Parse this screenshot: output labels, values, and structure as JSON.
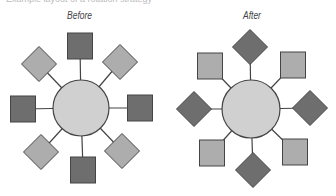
{
  "header": {
    "cutoff_text": "Example layout of a rotation strategy"
  },
  "panels": [
    {
      "label": "Before",
      "center": {
        "cx": 81,
        "cy": 108,
        "r": 28
      },
      "nodes": [
        {
          "shape": "square",
          "tone": "dark",
          "cx": 80,
          "cy": 46
        },
        {
          "shape": "diamond",
          "tone": "light",
          "cx": 39,
          "cy": 64
        },
        {
          "shape": "diamond",
          "tone": "light",
          "cx": 120,
          "cy": 62
        },
        {
          "shape": "square",
          "tone": "dark",
          "cx": 23,
          "cy": 109
        },
        {
          "shape": "square",
          "tone": "dark",
          "cx": 140,
          "cy": 108
        },
        {
          "shape": "diamond",
          "tone": "light",
          "cx": 41,
          "cy": 152
        },
        {
          "shape": "diamond",
          "tone": "light",
          "cx": 122,
          "cy": 151
        },
        {
          "shape": "square",
          "tone": "dark",
          "cx": 83,
          "cy": 170
        }
      ]
    },
    {
      "label": "After",
      "center": {
        "cx": 251,
        "cy": 109,
        "r": 29
      },
      "nodes": [
        {
          "shape": "diamond",
          "tone": "dark",
          "cx": 250,
          "cy": 47
        },
        {
          "shape": "square",
          "tone": "light",
          "cx": 210,
          "cy": 66
        },
        {
          "shape": "square",
          "tone": "light",
          "cx": 293,
          "cy": 65
        },
        {
          "shape": "diamond",
          "tone": "dark",
          "cx": 194,
          "cy": 109
        },
        {
          "shape": "diamond",
          "tone": "dark",
          "cx": 310,
          "cy": 108
        },
        {
          "shape": "square",
          "tone": "light",
          "cx": 212,
          "cy": 153
        },
        {
          "shape": "square",
          "tone": "light",
          "cx": 295,
          "cy": 152
        },
        {
          "shape": "diamond",
          "tone": "dark",
          "cx": 253,
          "cy": 170
        }
      ]
    }
  ],
  "colors": {
    "dark": "#6e6e6e",
    "light": "#adadad",
    "circle": "#d0d0d0",
    "stroke": "#444444"
  }
}
